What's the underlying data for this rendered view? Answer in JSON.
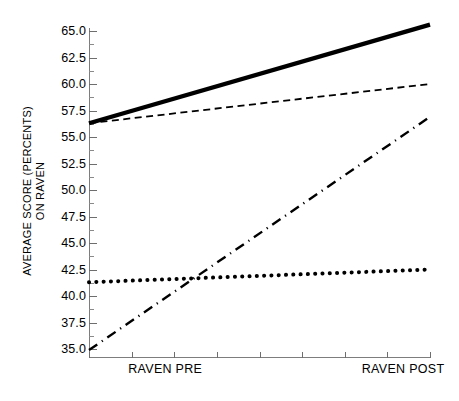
{
  "chart_data": {
    "type": "line",
    "title": "",
    "xlabel": "",
    "ylabel": "AVERAGE SCORE (PERCENTS) ON RAVEN",
    "ylabel_line1": "AVERAGE SCORE (PERCENTS)",
    "ylabel_line2": "ON RAVEN",
    "ylim": [
      35.0,
      65.8
    ],
    "y_major_ticks": [
      35.0,
      37.5,
      40.0,
      42.5,
      45.0,
      47.5,
      50.0,
      52.5,
      55.0,
      57.5,
      60.0,
      62.5,
      65.0
    ],
    "y_tick_labels": [
      "35.0",
      "37.5",
      "40.0",
      "42.5",
      "45.0",
      "47.5",
      "50.0",
      "52.5",
      "55.0",
      "57.5",
      "60.0",
      "62.5",
      "65.0"
    ],
    "y_minor_ticks": [
      36.25,
      38.75,
      41.25,
      43.75,
      46.25,
      48.75,
      51.25,
      53.75,
      56.25,
      58.75,
      61.25,
      63.75
    ],
    "grid": false,
    "legend": "none",
    "x": [
      0,
      1
    ],
    "x_tick_labels": [
      "RAVEN PRE",
      "RAVEN POST"
    ],
    "x_tick_label_positions": [
      0.115,
      0.8
    ],
    "x_tick_count": 9,
    "categories": [
      "RAVEN PRE",
      "RAVEN POST"
    ],
    "series": [
      {
        "name": "solid-line",
        "style": "solid",
        "color": "#000000",
        "width": 4.2,
        "values": [
          56.3,
          65.6
        ]
      },
      {
        "name": "dashed-line",
        "style": "dashed",
        "color": "#000000",
        "width": 1.8,
        "values": [
          56.3,
          60.0
        ]
      },
      {
        "name": "dash-dot-line",
        "style": "dash-dot",
        "color": "#000000",
        "width": 2.4,
        "values": [
          34.9,
          56.9
        ]
      },
      {
        "name": "dotted-line",
        "style": "dotted",
        "color": "#000000",
        "width": 4.0,
        "values": [
          41.3,
          42.5
        ]
      }
    ]
  }
}
